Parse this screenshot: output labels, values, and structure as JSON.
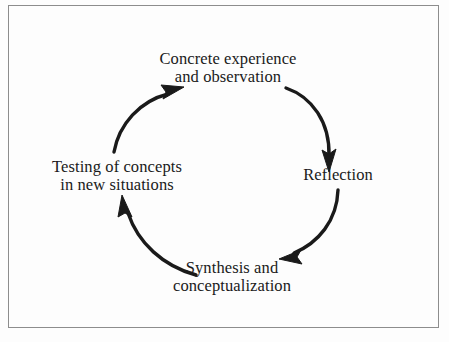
{
  "figure": {
    "type": "cycle-diagram",
    "orientation": "clockwise",
    "background_color": "#fdfdfd",
    "border_color": "#8d8d8d",
    "ink_color": "#1a1a1a",
    "nodes": [
      {
        "id": "concrete",
        "position": "top",
        "lines": [
          "Concrete experience",
          "and observation"
        ]
      },
      {
        "id": "reflection",
        "position": "right",
        "lines": [
          "Reflection"
        ]
      },
      {
        "id": "synthesis",
        "position": "bottom",
        "lines": [
          "Synthesis and",
          "conceptualization"
        ]
      },
      {
        "id": "testing",
        "position": "left",
        "lines": [
          "Testing of concepts",
          "in new situations"
        ]
      }
    ],
    "arrows": [
      {
        "id": "arrow-concrete-to-reflection",
        "from": "concrete",
        "to": "reflection",
        "direction": "down-right"
      },
      {
        "id": "arrow-reflection-to-synthesis",
        "from": "reflection",
        "to": "synthesis",
        "direction": "down-left"
      },
      {
        "id": "arrow-synthesis-to-testing",
        "from": "synthesis",
        "to": "testing",
        "direction": "up-left"
      },
      {
        "id": "arrow-testing-to-concrete",
        "from": "testing",
        "to": "concrete",
        "direction": "up-right"
      }
    ]
  }
}
